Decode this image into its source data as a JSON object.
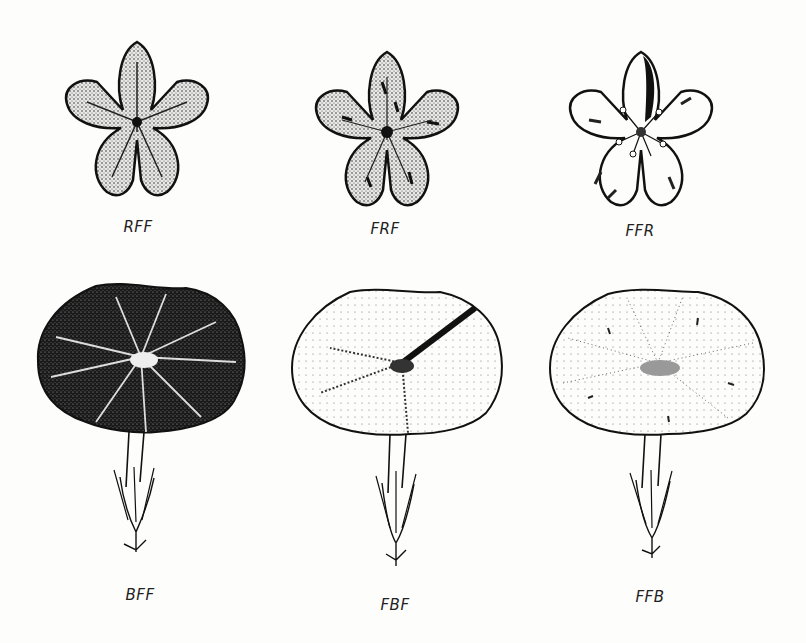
{
  "figure": {
    "rows": [
      {
        "name": "flowers-top-view",
        "items": [
          {
            "label": "RFF",
            "type": "star-flower",
            "shading": "full-stipple"
          },
          {
            "label": "FRF",
            "type": "star-flower",
            "shading": "stipple-with-streaks"
          },
          {
            "label": "FFR",
            "type": "star-flower",
            "shading": "light-with-dark-sector"
          }
        ]
      },
      {
        "name": "flowers-funnel-view",
        "items": [
          {
            "label": "BFF",
            "type": "funnel-flower",
            "shading": "dark"
          },
          {
            "label": "FBF",
            "type": "funnel-flower",
            "shading": "light-with-dark-sector"
          },
          {
            "label": "FFB",
            "type": "funnel-flower",
            "shading": "light-dotted"
          }
        ]
      }
    ],
    "colors": {
      "ink": "#111111",
      "background": "#fdfdfb",
      "dark_fill": "#1a1a1a",
      "stipple_fill": "#8a8a8a"
    }
  }
}
